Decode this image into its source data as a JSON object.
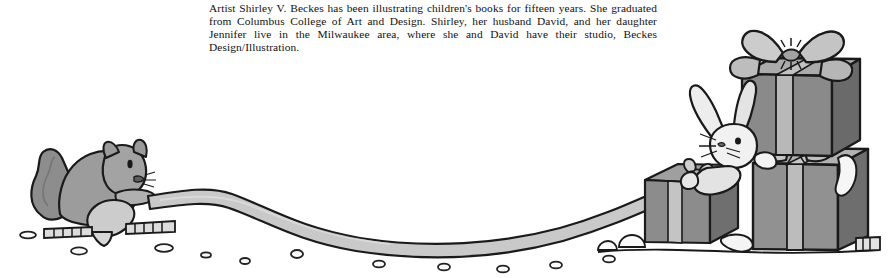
{
  "page": {
    "width": 889,
    "height": 278,
    "background_color": "#ffffff",
    "kind": "book-jacket-illustration-with-artist-bio"
  },
  "bio": {
    "paragraph": "Artist Shirley V. Beckes has been illustrating children's books for fifteen years. She graduated from Columbus College of Art and Design. Shirley, her husband David, and her daughter Jennifer live in the Milwaukee area, where she and David have their studio, Beckes Design/Illustration.",
    "lines": [
      "Artist Shirley V. Beckes has been illustrating children's books for fifteen years. She graduated",
      "from Columbus College of Art and Design. Shirley, her husband David, and her daughter",
      "Jennifer live in the Milwaukee area, where she and David have their studio, Beckes Design/",
      "Illustration."
    ],
    "text_color": "#111111"
  },
  "illustration": {
    "title": "Squirrel pulling a ribbon from a stack of gift boxes with a rabbit",
    "scene_elements": [
      "squirrel",
      "ribbon",
      "ground-snow-marks",
      "small-gift-box",
      "large-gift-box",
      "top-gift-box",
      "rabbit",
      "bow-top",
      "bow-middle",
      "bow-small"
    ],
    "palette": {
      "outline": "#1a1a1a",
      "squirrel_body": "#9a9a9a",
      "squirrel_tail": "#8f8f8f",
      "squirrel_belly": "#cfcfcf",
      "ribbon": "#c9c9c9",
      "box_front_light": "#9b9b9b",
      "box_front_mid": "#868686",
      "box_side_dark": "#6e6e6e",
      "box_top_light": "#b4b4b4",
      "bow_light": "#c2c2c2",
      "bow_mid": "#a8a8a8",
      "rabbit_body": "#eeeeee",
      "rabbit_shade": "#cccccc",
      "snow": "#ffffff",
      "ground_mark": "#2a2a2a"
    }
  }
}
